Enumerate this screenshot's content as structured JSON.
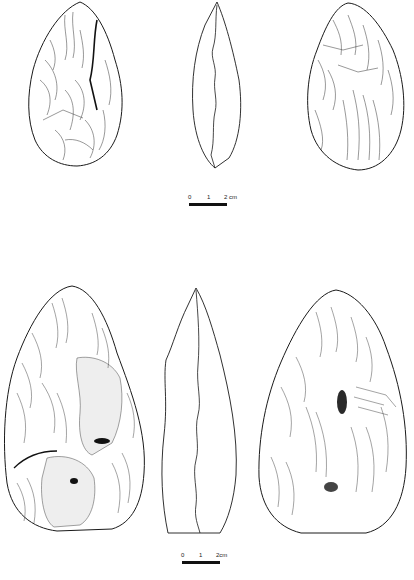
{
  "figure": {
    "type": "archaeological lithic illustration",
    "rows": [
      {
        "id": "handaxe-1",
        "views": [
          "front-face",
          "side-profile",
          "back-face"
        ],
        "scale_bar": {
          "labels": [
            "0",
            "1",
            "2 cm"
          ]
        }
      },
      {
        "id": "handaxe-2",
        "views": [
          "front-face",
          "side-profile",
          "back-face"
        ],
        "scale_bar": {
          "labels": [
            "0",
            "1",
            "2cm"
          ]
        }
      }
    ]
  },
  "colors": {
    "line": "#1a1a1a",
    "background": "#ffffff",
    "cortex": "#e9e9e9",
    "dark": "#222222"
  }
}
